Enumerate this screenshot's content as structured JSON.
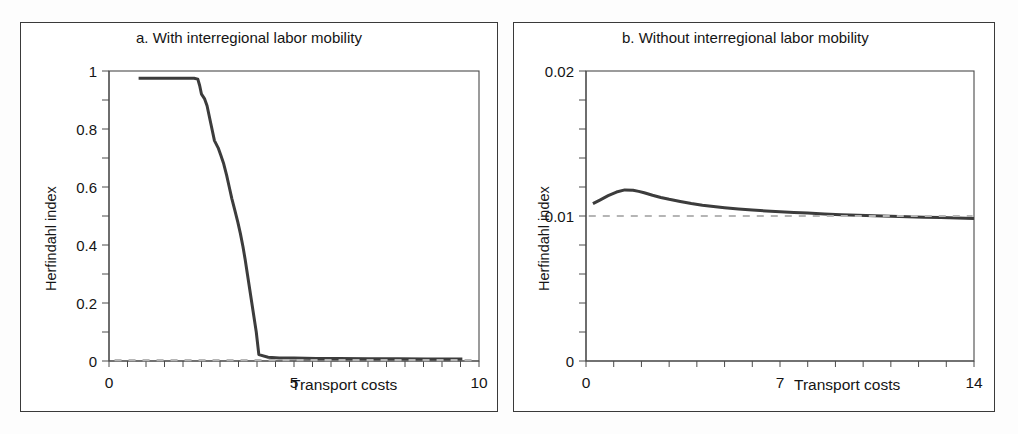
{
  "figure": {
    "background_color": "#ffffff",
    "border_color": "#3a3a3a",
    "curve_color": "#3c3c3c",
    "reference_line_color": "#b5b5b5"
  },
  "panels": [
    {
      "id": "a",
      "title": "a. With interregional labor mobility",
      "y_axis_label": "Herfindahl index",
      "x_axis_label": "Transport costs",
      "y_ticks": [
        "0",
        "0.2",
        "0.4",
        "0.6",
        "0.8",
        "1"
      ],
      "x_ticks": [
        "0",
        "5",
        "10"
      ]
    },
    {
      "id": "b",
      "title": "b. Without interregional labor mobility",
      "y_axis_label": "Herfindahl index",
      "x_axis_label": "Transport costs",
      "y_ticks": [
        "0",
        "0.01",
        "0.02"
      ],
      "x_ticks": [
        "0",
        "7",
        "14"
      ]
    }
  ],
  "chart_data": [
    {
      "type": "line",
      "title": "a. With interregional labor mobility",
      "xlabel": "Transport costs",
      "ylabel": "Herfindahl index",
      "xlim": [
        0,
        10
      ],
      "ylim": [
        0,
        1
      ],
      "xticks": [
        0,
        5,
        10
      ],
      "yticks": [
        0,
        0.2,
        0.4,
        0.6,
        0.8,
        1
      ],
      "grid": false,
      "legend": "none",
      "series": [
        {
          "name": "Herfindahl index (mobility)",
          "style": "solid",
          "color": "#3c3c3c",
          "x": [
            0.8,
            1.0,
            1.3,
            1.6,
            1.9,
            2.1,
            2.3,
            2.4,
            2.45,
            2.5,
            2.58,
            2.65,
            2.75,
            2.85,
            2.95,
            3.02,
            3.1,
            3.18,
            3.25,
            3.32,
            3.4,
            3.48,
            3.55,
            3.62,
            3.68,
            3.74,
            3.8,
            3.86,
            3.92,
            3.98,
            4.05,
            4.3,
            4.6,
            5.0,
            5.6,
            6.2,
            7.0,
            7.8,
            8.6,
            9.2,
            9.55
          ],
          "y": [
            0.975,
            0.975,
            0.975,
            0.975,
            0.975,
            0.975,
            0.975,
            0.972,
            0.95,
            0.92,
            0.905,
            0.88,
            0.82,
            0.76,
            0.735,
            0.71,
            0.68,
            0.64,
            0.6,
            0.56,
            0.52,
            0.48,
            0.44,
            0.395,
            0.35,
            0.3,
            0.25,
            0.2,
            0.15,
            0.1,
            0.022,
            0.013,
            0.01,
            0.01,
            0.009,
            0.009,
            0.008,
            0.008,
            0.007,
            0.007,
            0.007
          ]
        },
        {
          "name": "Reference level",
          "style": "dashed",
          "color": "#b5b5b5",
          "x": [
            0.15,
            9.85
          ],
          "y": [
            0.003,
            0.003
          ]
        }
      ]
    },
    {
      "type": "line",
      "title": "b. Without interregional labor mobility",
      "xlabel": "Transport costs",
      "ylabel": "Herfindahl index",
      "xlim": [
        0,
        14
      ],
      "ylim": [
        0,
        0.02
      ],
      "xticks": [
        0,
        7,
        14
      ],
      "yticks": [
        0,
        0.01,
        0.02
      ],
      "grid": false,
      "legend": "none",
      "series": [
        {
          "name": "Herfindahl index (no mobility)",
          "style": "solid",
          "color": "#3c3c3c",
          "x": [
            0.25,
            0.5,
            0.8,
            1.1,
            1.4,
            1.7,
            1.9,
            2.1,
            2.4,
            2.7,
            3.0,
            3.4,
            3.8,
            4.2,
            4.6,
            5.0,
            5.5,
            6.0,
            6.5,
            7.0,
            7.5,
            8.0,
            8.6,
            9.2,
            9.8,
            10.4,
            11.0,
            11.6,
            12.2,
            12.8,
            13.4,
            14.0
          ],
          "y": [
            0.01085,
            0.0111,
            0.0114,
            0.01165,
            0.0118,
            0.01178,
            0.0117,
            0.0116,
            0.01143,
            0.01128,
            0.01115,
            0.011,
            0.01086,
            0.01074,
            0.01065,
            0.01057,
            0.01048,
            0.01041,
            0.01035,
            0.0103,
            0.01025,
            0.0102,
            0.01014,
            0.01009,
            0.01005,
            0.01001,
            0.00998,
            0.00995,
            0.00992,
            0.00989,
            0.00986,
            0.00983
          ]
        },
        {
          "name": "Reference level 0.01",
          "style": "dashed",
          "color": "#b5b5b5",
          "x": [
            0.1,
            13.95
          ],
          "y": [
            0.01,
            0.01
          ]
        }
      ]
    }
  ]
}
